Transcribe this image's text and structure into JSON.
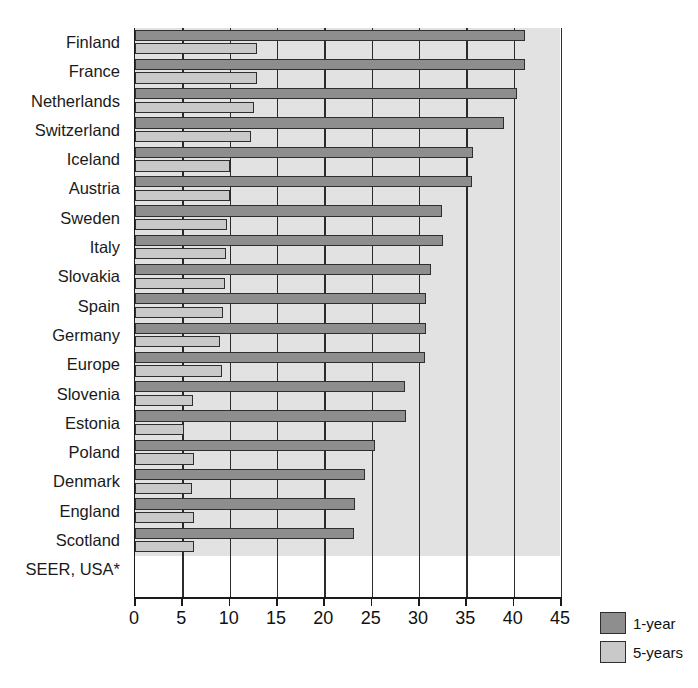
{
  "chart_data": {
    "type": "bar",
    "orientation": "horizontal",
    "title": "",
    "xlabel": "",
    "ylabel": "",
    "xlim": [
      0,
      45
    ],
    "xticks": [
      0,
      5,
      10,
      15,
      20,
      25,
      30,
      35,
      40,
      45
    ],
    "grid": true,
    "legend_position": "bottom-right",
    "categories": [
      "Finland",
      "France",
      "Netherlands",
      "Switzerland",
      "Iceland",
      "Austria",
      "Sweden",
      "Italy",
      "Slovakia",
      "Spain",
      "Germany",
      "Europe",
      "Slovenia",
      "Estonia",
      "Poland",
      "Denmark",
      "England",
      "Scotland",
      "SEER, USA*"
    ],
    "series": [
      {
        "name": "1-year",
        "color": "#8e8e8e",
        "values": [
          41.2,
          41.2,
          40.3,
          39.0,
          35.7,
          35.6,
          32.4,
          32.5,
          31.3,
          30.7,
          30.7,
          30.6,
          28.5,
          28.6,
          25.3,
          24.3,
          23.2,
          23.1,
          12.5
        ]
      },
      {
        "name": "5-years",
        "color": "#c9c9c9",
        "values": [
          12.9,
          12.9,
          12.6,
          12.3,
          10.0,
          10.0,
          9.7,
          9.6,
          9.5,
          9.3,
          9.0,
          9.2,
          6.1,
          5.2,
          6.2,
          6.0,
          6.2,
          6.2,
          6.0
        ]
      }
    ]
  },
  "legend": {
    "items": [
      {
        "label": "1-year",
        "color": "#8e8e8e"
      },
      {
        "label": "5-years",
        "color": "#c9c9c9"
      }
    ]
  }
}
